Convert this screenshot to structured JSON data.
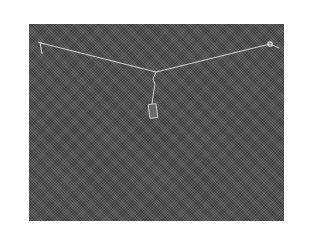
{
  "image": {
    "description": "Grayscale photograph of a taut wire strung across a dark textured fabric background, with a small weight hanging from the center point",
    "colors": {
      "page_background": "#ffffff",
      "fabric": "#555555",
      "wire": "#d8d8d8"
    },
    "elements": {
      "wire_left_anchor": {
        "x": 41,
        "y": 43
      },
      "wire_right_anchor": {
        "x": 270,
        "y": 44
      },
      "wire_center": {
        "x": 156,
        "y": 72
      },
      "hanging_weight": {
        "x": 153,
        "y": 108
      }
    }
  }
}
